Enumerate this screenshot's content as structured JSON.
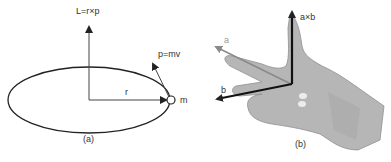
{
  "panel_a": {
    "caption": "(a)",
    "labels": {
      "angular_momentum": "L=r×p",
      "momentum": "p=mv",
      "radius": "r",
      "mass": "m"
    }
  },
  "panel_b": {
    "caption": "(b)",
    "labels": {
      "vector_a": "a",
      "vector_b": "b",
      "cross_product": "a×b"
    }
  },
  "colors": {
    "stroke": "#222222",
    "hand_fill": "#b4b4b4",
    "hand_shade": "#9a9a9a",
    "vector_a": "#8a8a8a"
  }
}
